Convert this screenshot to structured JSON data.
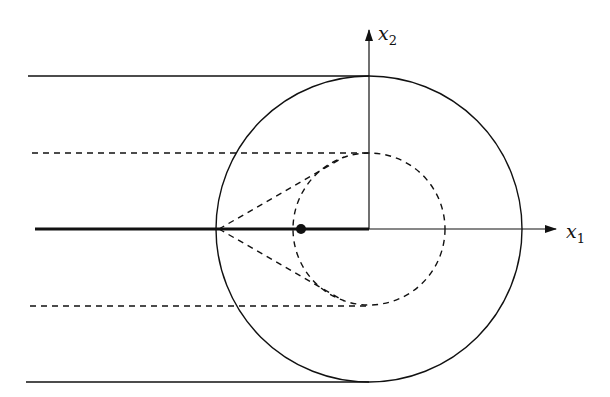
{
  "diagram": {
    "axes": {
      "x_label": "x",
      "x_sub": "1",
      "y_label": "x",
      "y_sub": "2"
    },
    "colors": {
      "stroke": "#111111",
      "background": "#ffffff"
    },
    "geometry": {
      "origin": [
        369,
        229
      ],
      "outer_circle_radius": 153,
      "inner_dashed_circle_radius": 76,
      "point_marker": [
        301,
        229
      ],
      "tangent_apex": [
        219,
        229
      ]
    }
  }
}
